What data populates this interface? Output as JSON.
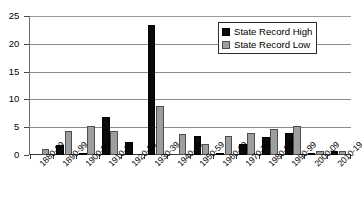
{
  "chart_data": {
    "type": "bar",
    "title": "",
    "subtitle": "",
    "xlabel": "",
    "ylabel": "",
    "ylim": [
      0,
      25
    ],
    "yticks": [
      0,
      5,
      10,
      15,
      20,
      25
    ],
    "grid": true,
    "legend_position": "top-right",
    "categories": [
      "1880-89",
      "1890-99",
      "1900-09",
      "1910-19",
      "1920-29",
      "1930-39",
      "1940-49",
      "1950-59",
      "1960-69",
      "1970-79",
      "1980-89",
      "1990-99",
      "2000-09",
      "2010-19"
    ],
    "series": [
      {
        "name": "State Record High",
        "color": "#0b0b0b",
        "values": [
          0,
          1.8,
          0.4,
          6.8,
          2.4,
          23.3,
          0,
          3.4,
          0.3,
          2.0,
          3.3,
          3.9,
          0.3,
          0.7
        ]
      },
      {
        "name": "State Record Low",
        "color": "#9e9e9e",
        "values": [
          1.0,
          4.4,
          5.2,
          4.4,
          0,
          8.9,
          3.7,
          1.9,
          3.4,
          3.9,
          4.7,
          5.3,
          0.8,
          0.7
        ]
      }
    ]
  },
  "legend": {
    "items": [
      {
        "label": "State Record High",
        "swatch": "high"
      },
      {
        "label": "State Record Low",
        "swatch": "low"
      }
    ]
  }
}
